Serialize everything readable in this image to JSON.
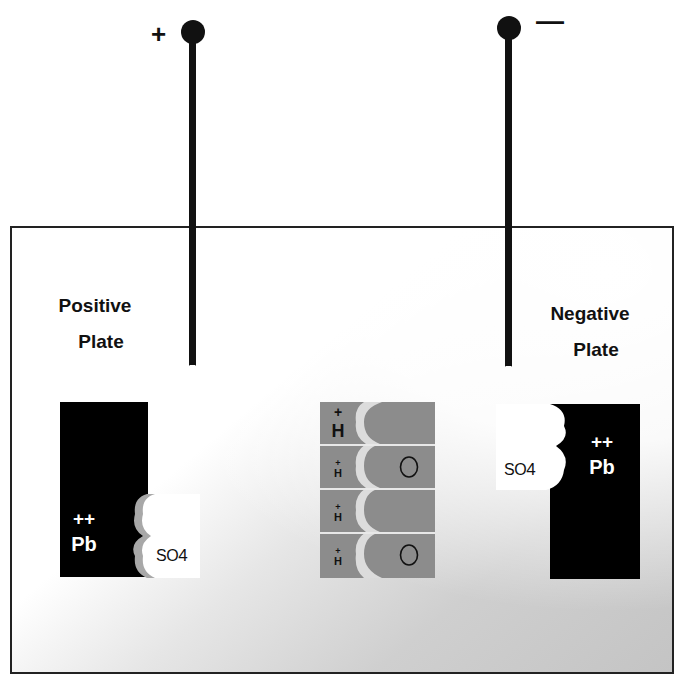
{
  "diagram": {
    "terminals": {
      "positive": {
        "sign": "+"
      },
      "negative": {
        "sign": "—"
      }
    },
    "positive_plate": {
      "label_line1": "Positive",
      "label_line2": "Plate",
      "ion_charge": "++",
      "ion": "Pb",
      "sulfate": "SO4",
      "sulfate_base": "SO",
      "sulfate_sub": "4"
    },
    "negative_plate": {
      "label_line1": "Negative",
      "label_line2": "Plate",
      "ion_charge": "++",
      "ion": "Pb",
      "sulfate": "SO4",
      "sulfate_base": "SO",
      "sulfate_sub": "4"
    },
    "water_molecules": [
      {
        "h_charge": "+",
        "h": "H",
        "o": ""
      },
      {
        "h_charge": "+",
        "h": "H",
        "o": "O"
      },
      {
        "h_charge": "+",
        "h": "H",
        "o": ""
      },
      {
        "h_charge": "+",
        "h": "H",
        "o": "O"
      }
    ],
    "colors": {
      "plate": "#000000",
      "electrolyte_gray": "#8c8c8c",
      "background": "#ffffff",
      "outline": "#222222"
    }
  }
}
